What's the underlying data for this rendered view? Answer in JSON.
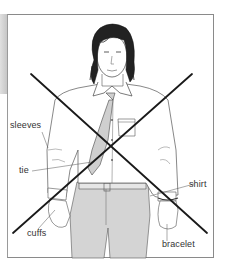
{
  "illustration": {
    "subject": "man-wearing-shirt-tie-bracelet",
    "crossed_out": true,
    "labels": [
      {
        "id": "sleeves",
        "text": "sleeves"
      },
      {
        "id": "tie",
        "text": "tie"
      },
      {
        "id": "shirt",
        "text": "shirt"
      },
      {
        "id": "cuffs",
        "text": "cuffs"
      },
      {
        "id": "bracelet",
        "text": "bracelet"
      }
    ]
  },
  "colors": {
    "line": "#1a1a1a",
    "fill_gray": "#d4d4d4",
    "frame": "#8a8a8a",
    "label_text": "#333333"
  }
}
